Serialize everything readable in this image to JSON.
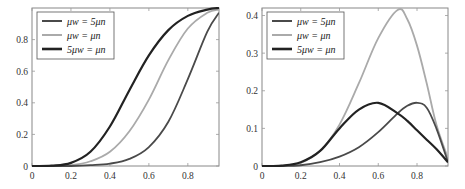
{
  "chart_data": [
    {
      "type": "line",
      "title": "",
      "xlabel": "",
      "ylabel": "",
      "xlim": [
        0,
        0.96
      ],
      "ylim": [
        0,
        1.0
      ],
      "xticks": [
        "0",
        "0.2",
        "0.4",
        "0.6",
        "0.8"
      ],
      "yticks": [
        "0",
        "0.2",
        "0.4",
        "0.6",
        "0.8"
      ],
      "grid": false,
      "legend_position": "upper left",
      "x": [
        0,
        0.1,
        0.2,
        0.3,
        0.4,
        0.5,
        0.6,
        0.7,
        0.8,
        0.9,
        0.96
      ],
      "series": [
        {
          "name": "μ_w = 5μ_n",
          "color": "#4a4a4a",
          "values": [
            0,
            0.0,
            0.0,
            0.005,
            0.015,
            0.045,
            0.12,
            0.28,
            0.55,
            0.85,
            0.97
          ]
        },
        {
          "name": "μ_w = μ_n",
          "color": "#aaaaaa",
          "values": [
            0,
            0.0,
            0.005,
            0.03,
            0.09,
            0.22,
            0.42,
            0.67,
            0.87,
            0.97,
            0.99
          ]
        },
        {
          "name": "5μ_w = μ_n",
          "color": "#222222",
          "values": [
            0,
            0.002,
            0.02,
            0.09,
            0.25,
            0.48,
            0.7,
            0.86,
            0.95,
            0.99,
            1.0
          ]
        }
      ]
    },
    {
      "type": "line",
      "title": "",
      "xlabel": "",
      "ylabel": "",
      "xlim": [
        0,
        0.96
      ],
      "ylim": [
        0,
        0.42
      ],
      "xticks": [
        "0",
        "0.2",
        "0.4",
        "0.6",
        "0.8"
      ],
      "yticks": [
        "0",
        "0.1",
        "0.2",
        "0.3",
        "0.4"
      ],
      "grid": false,
      "legend_position": "upper left",
      "x": [
        0,
        0.1,
        0.2,
        0.3,
        0.4,
        0.5,
        0.6,
        0.7,
        0.75,
        0.8,
        0.85,
        0.9,
        0.96
      ],
      "series": [
        {
          "name": "μ_w = 5μ_n",
          "color": "#4a4a4a",
          "values": [
            0,
            0.0,
            0.002,
            0.01,
            0.025,
            0.05,
            0.09,
            0.14,
            0.16,
            0.168,
            0.155,
            0.1,
            0.01
          ]
        },
        {
          "name": "μ_w = μ_n",
          "color": "#aaaaaa",
          "values": [
            0,
            0.0,
            0.008,
            0.04,
            0.11,
            0.22,
            0.34,
            0.415,
            0.39,
            0.32,
            0.22,
            0.11,
            0.02
          ]
        },
        {
          "name": "5μ_w = μ_n",
          "color": "#222222",
          "values": [
            0,
            0.001,
            0.01,
            0.04,
            0.1,
            0.15,
            0.168,
            0.14,
            0.12,
            0.095,
            0.07,
            0.045,
            0.01
          ]
        }
      ]
    }
  ],
  "legend": {
    "entries": [
      {
        "label": "μw = 5μn",
        "color": "#4a4a4a",
        "width": 2
      },
      {
        "label": "μw = μn",
        "color": "#aaaaaa",
        "width": 2
      },
      {
        "label": "5μw = μn",
        "color": "#222222",
        "width": 2.6
      }
    ]
  }
}
